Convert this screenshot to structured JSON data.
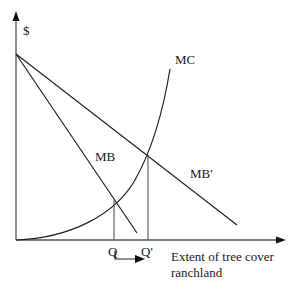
{
  "diagram": {
    "type": "economics-marginal-curves",
    "y_axis_label": "$",
    "x_axis_label_line1": "Extent of tree cover",
    "x_axis_label_line2": "ranchland",
    "curves": [
      {
        "name": "MC",
        "label": "MC",
        "shape": "convex-increasing"
      },
      {
        "name": "MB",
        "label": "MB",
        "shape": "linear-decreasing-steep"
      },
      {
        "name": "MB'",
        "label": "MB'",
        "shape": "linear-decreasing-shallow"
      }
    ],
    "markers": [
      {
        "name": "Q",
        "label": "Q"
      },
      {
        "name": "Q'",
        "label": "Q'"
      }
    ],
    "shift_arrow": {
      "from": "Q",
      "to": "Q'"
    },
    "colors": {
      "line": "#222222",
      "text": "#1a1a1a",
      "background": "#ffffff"
    }
  }
}
